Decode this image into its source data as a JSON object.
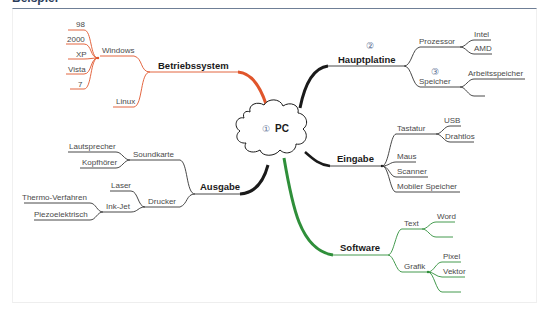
{
  "header": {
    "title": "Beispiel"
  },
  "colors": {
    "betriebssystem": "#e0552b",
    "hardware": "#1a1a1a",
    "software": "#2f8f3a",
    "header_line": "#6f7f96",
    "number_marker": "#5a6e92"
  },
  "center": {
    "number": "①",
    "label": "PC"
  },
  "branches": {
    "betriebssystem": {
      "label": "Betriebssystem",
      "children": {
        "windows": {
          "label": "Windows",
          "children": [
            "98",
            "2000",
            "XP",
            "Vista",
            "7"
          ]
        },
        "linux": {
          "label": "Linux"
        }
      }
    },
    "hauptplatine": {
      "number": "②",
      "label": "Hauptplatine",
      "children": {
        "prozessor": {
          "label": "Prozessor",
          "children": [
            "Intel",
            "AMD"
          ]
        },
        "speicher": {
          "number": "③",
          "label": "Speicher",
          "children": [
            "Arbeitsspeicher",
            ""
          ]
        }
      }
    },
    "ausgabe": {
      "label": "Ausgabe",
      "children": {
        "soundkarte": {
          "label": "Soundkarte",
          "children": [
            "Lautsprecher",
            "Kopfhörer"
          ]
        },
        "drucker": {
          "label": "Drucker",
          "children": {
            "laser": {
              "label": "Laser"
            },
            "inkjet": {
              "label": "Ink-Jet",
              "children": [
                "Thermo-Verfahren",
                "Piezoelektrisch"
              ]
            }
          }
        }
      }
    },
    "eingabe": {
      "label": "Eingabe",
      "children": {
        "tastatur": {
          "label": "Tastatur",
          "children": [
            "USB",
            "Drahtlos"
          ]
        },
        "maus": {
          "label": "Maus"
        },
        "scanner": {
          "label": "Scanner"
        },
        "mobiler_speicher": {
          "label": "Mobiler Speicher"
        }
      }
    },
    "software": {
      "label": "Software",
      "children": {
        "text": {
          "label": "Text",
          "children": [
            "Word",
            ""
          ]
        },
        "grafik": {
          "label": "Grafik",
          "children": [
            "Pixel",
            "Vektor",
            ""
          ]
        }
      }
    }
  }
}
